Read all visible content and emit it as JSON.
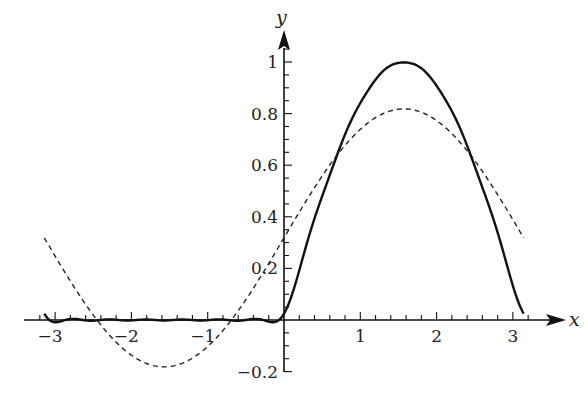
{
  "chart_data": {
    "type": "line",
    "title": "",
    "xlabel": "x",
    "ylabel": "y",
    "xlim": [
      -3.4,
      3.3
    ],
    "ylim": [
      -0.22,
      1.13
    ],
    "grid": false,
    "legend": null,
    "x_ticks": [
      -3,
      -2,
      -1,
      1,
      2,
      3
    ],
    "x_tick_labels": [
      "−3",
      "−2",
      "−1",
      "1",
      "2",
      "3"
    ],
    "y_ticks": [
      -0.2,
      0.2,
      0.4,
      0.6,
      0.8,
      1
    ],
    "y_tick_labels": [
      "−0.2",
      "0.2",
      "0.4",
      "0.6",
      "0.8",
      "1"
    ],
    "x_minor_step": 0.2,
    "y_minor_step": 0.05,
    "series": [
      {
        "name": "solid",
        "style": "solid",
        "description": "higher-order Fourier approximation of half-wave rectified sine",
        "x_range": [
          -3.14159,
          3.14159
        ],
        "fourier_terms": 6,
        "points": [
          [
            -3,
            0.0
          ],
          [
            -2,
            0.0
          ],
          [
            -1,
            0.0
          ],
          [
            -0.7,
            0.01
          ],
          [
            -0.25,
            -0.01
          ],
          [
            0,
            0.03
          ],
          [
            0.5,
            0.48
          ],
          [
            1,
            0.84
          ],
          [
            1.57,
            1.0
          ],
          [
            2,
            0.91
          ],
          [
            2.5,
            0.6
          ],
          [
            3,
            0.14
          ],
          [
            3.14,
            0.0
          ]
        ]
      },
      {
        "name": "dashed",
        "style": "dashed",
        "description": "1/π + (1/2) sin x",
        "x_range": [
          -3.14159,
          3.14159
        ],
        "fourier_terms": 0,
        "points": [
          [
            -3.14,
            0.32
          ],
          [
            -2.5,
            0.02
          ],
          [
            -1.57,
            -0.18
          ],
          [
            -1,
            -0.1
          ],
          [
            0,
            0.32
          ],
          [
            1,
            0.74
          ],
          [
            1.57,
            0.82
          ],
          [
            2.5,
            0.62
          ],
          [
            3.14,
            0.32
          ]
        ]
      }
    ]
  }
}
